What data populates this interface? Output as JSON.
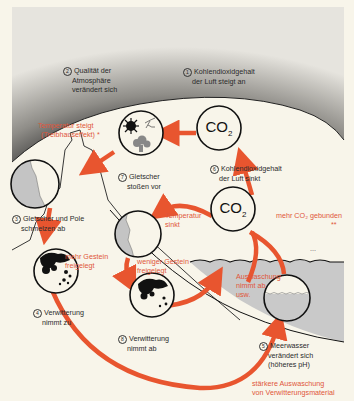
{
  "colors": {
    "background": "#f8f5ea",
    "sky_dark": "#3a3a3a",
    "sky_light": "#e6e4de",
    "arrow": "#e8552f",
    "red_text": "#e0563a",
    "water": "#c9c9c9",
    "ice": "#c4c4c4"
  },
  "labels": {
    "step1": {
      "num": "1",
      "text_line1": "Kohlendioxidgehalt",
      "text_line2": "der Luft steigt an"
    },
    "step2": {
      "num": "2",
      "text_line1": "Qualität der",
      "text_line2": "Atmosphäre",
      "text_line3": "verändert sich"
    },
    "step3": {
      "num": "3",
      "text_line1": "Gletscher und Pole",
      "text_line2": "schmelzen ab"
    },
    "step4": {
      "num": "4",
      "text_line1": "Verwitterung",
      "text_line2": "nimmt zu"
    },
    "step5": {
      "num": "5",
      "text_line1": "Meerwasser",
      "text_line2": "verändert sich",
      "text_line3": "(höheres pH)"
    },
    "step6": {
      "num": "6",
      "text_line1": "Kohlendioxidgehalt",
      "text_line2": "der Luft sinkt"
    },
    "step7": {
      "num": "7",
      "text_line1": "Gletscher",
      "text_line2": "stoßen vor"
    },
    "step8": {
      "num": "8",
      "text_line1": "Verwitterung",
      "text_line2": "nimmt ab"
    }
  },
  "red_labels": {
    "temp_rises_line1": "Temperatur steigt",
    "temp_rises_line2": "(Treibhauseffekt) *",
    "temp_falls_line1": "Temperatur",
    "temp_falls_line2": "sinkt",
    "more_rock_line1": "mehr Gestein",
    "more_rock_line2": "freigelegt",
    "less_rock_line1": "weniger Gestein",
    "less_rock_line2": "freigelegt",
    "more_co2_bound": "mehr CO₂ gebunden",
    "more_co2_mark": "**",
    "leaching_line1": "Auswaschung",
    "leaching_line2": "nimmt ab",
    "leaching_line3": "usw.",
    "stronger_leaching_line1": "stärkere Auswaschung",
    "stronger_leaching_line2": "von Verwitterungsmaterial"
  },
  "co2_circles": {
    "top": {
      "text": "CO",
      "sub": "2"
    },
    "middle": {
      "text": "CO",
      "sub": "2"
    }
  },
  "misc": {
    "ellipsis_mark": "..."
  }
}
